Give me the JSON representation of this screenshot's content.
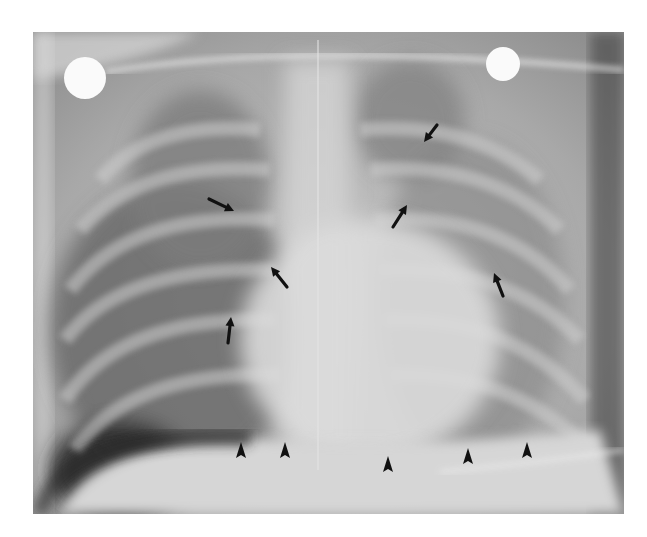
{
  "image": {
    "description": "Frontal chest radiograph with annotation arrows and arrowheads",
    "frame": {
      "x": 33,
      "y": 32,
      "width": 591,
      "height": 482
    },
    "colors": {
      "page_bg": "#ffffff",
      "annotation": "#111111"
    }
  },
  "annotations": {
    "arrows": [
      {
        "id": "arrow-1",
        "tail": [
          209,
          199
        ],
        "head": [
          234,
          211
        ]
      },
      {
        "id": "arrow-2",
        "tail": [
          287,
          287
        ],
        "head": [
          271,
          267
        ]
      },
      {
        "id": "arrow-3",
        "tail": [
          228,
          343
        ],
        "head": [
          231,
          317
        ]
      },
      {
        "id": "arrow-4",
        "tail": [
          437,
          125
        ],
        "head": [
          424,
          142
        ]
      },
      {
        "id": "arrow-5",
        "tail": [
          393,
          227
        ],
        "head": [
          407,
          205
        ]
      },
      {
        "id": "arrow-6",
        "tail": [
          503,
          296
        ],
        "head": [
          494,
          273
        ]
      }
    ],
    "arrowheads": [
      {
        "id": "arrowhead-1",
        "x": 241,
        "y": 452
      },
      {
        "id": "arrowhead-2",
        "x": 285,
        "y": 452
      },
      {
        "id": "arrowhead-3",
        "x": 388,
        "y": 466
      },
      {
        "id": "arrowhead-4",
        "x": 468,
        "y": 458
      },
      {
        "id": "arrowhead-5",
        "x": 527,
        "y": 452
      }
    ]
  },
  "markers": {
    "ecg_electrodes": [
      {
        "id": "electrode-left",
        "x": 85,
        "y": 78,
        "r": 21
      },
      {
        "id": "electrode-right",
        "x": 503,
        "y": 64,
        "r": 17
      }
    ]
  }
}
